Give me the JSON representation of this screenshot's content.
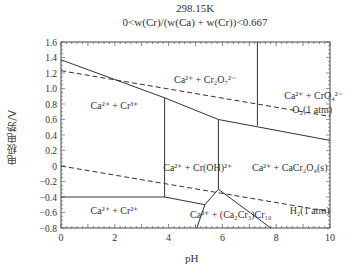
{
  "chart_data": {
    "type": "line",
    "title": "298.15K",
    "subtitle": "0<w(Cr)/(w(Ca) + w(Cr))<0.667",
    "xlabel": "pH",
    "ylabel": "电极电势/V",
    "xlim": [
      0,
      10
    ],
    "ylim": [
      -0.8,
      1.6
    ],
    "x_ticks": [
      "0",
      "2",
      "4",
      "6",
      "8",
      "10"
    ],
    "y_ticks": [
      "1.6",
      "1.4",
      "1.2",
      "1.0",
      "0.8",
      "0.6",
      "0.4",
      "0.2",
      "0",
      "−0.2",
      "−0.4",
      "−0.6",
      "−0.8"
    ],
    "grid": false,
    "series": [
      {
        "name": "Cr3+/Cr2O7 2- boundary",
        "style": "solid",
        "points": [
          [
            0,
            1.37
          ],
          [
            3.85,
            0.88
          ],
          [
            5.85,
            0.6
          ],
          [
            10,
            0.33
          ]
        ]
      },
      {
        "name": "Cr2O7 2-/CrO4 2- boundary",
        "style": "solid",
        "points": [
          [
            7.3,
            1.6
          ],
          [
            7.3,
            0.52
          ]
        ]
      },
      {
        "name": "Cr3+/Cr(OH)2+ boundary",
        "style": "solid",
        "points": [
          [
            3.85,
            0.88
          ],
          [
            3.85,
            -0.4
          ]
        ]
      },
      {
        "name": "Cr(OH)2+/CaCr2O4 boundary",
        "style": "solid",
        "points": [
          [
            5.85,
            0.6
          ],
          [
            5.85,
            -0.3
          ]
        ]
      },
      {
        "name": "Cr2+ upper boundary",
        "style": "solid",
        "points": [
          [
            0,
            -0.4
          ],
          [
            3.85,
            -0.4
          ],
          [
            5.35,
            -0.5
          ],
          [
            5.85,
            -0.3
          ]
        ]
      },
      {
        "name": "Ca2Cr3 left boundary",
        "style": "solid",
        "points": [
          [
            5.35,
            -0.5
          ],
          [
            5.05,
            -0.8
          ]
        ]
      },
      {
        "name": "Ca2Cr3 right boundary",
        "style": "solid",
        "points": [
          [
            5.85,
            -0.3
          ],
          [
            7.8,
            -0.8
          ]
        ]
      },
      {
        "name": "O2 (1 atm)",
        "style": "dashed",
        "points": [
          [
            0,
            1.23
          ],
          [
            10,
            0.64
          ]
        ]
      },
      {
        "name": "H2 (1 atm)",
        "style": "dashed",
        "points": [
          [
            0,
            0.0
          ],
          [
            10,
            -0.59
          ]
        ]
      }
    ],
    "regions": [
      {
        "label": "Ca²⁺ + Cr₂O₇²⁻",
        "pH": 4.2,
        "E": 1.07
      },
      {
        "label": "Ca²⁺ + CrO₄²⁻",
        "pH": 8.3,
        "E": 0.87
      },
      {
        "label": "Ca²⁺ + Cr³⁺",
        "pH": 1.1,
        "E": 0.73
      },
      {
        "label": "Ca²⁺ + Cr(OH)²⁺",
        "pH": 3.8,
        "E": -0.07
      },
      {
        "label": "Ca²⁺ + CaCr₂O₄(s)",
        "pH": 7.1,
        "E": -0.07
      },
      {
        "label": "Ca²⁺ + Cr²⁺",
        "pH": 1.1,
        "E": -0.62
      },
      {
        "label": "Ca²⁺ + (Ca₂Cr₃)Cr₁₀",
        "pH": 4.8,
        "E": -0.67
      }
    ],
    "annotations": [
      "O₂(1 atm)",
      "H₂(1 atm)"
    ]
  }
}
